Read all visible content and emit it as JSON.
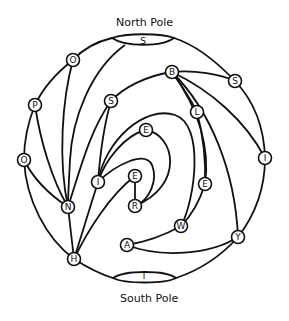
{
  "diagram": {
    "type": "graph on sphere",
    "labels": {
      "north_pole": "North Pole",
      "south_pole": "South Pole"
    },
    "poles": {
      "north": {
        "label": "S",
        "cx": 143,
        "cy": 42
      },
      "south": {
        "label": "T",
        "cx": 144,
        "cy": 278
      }
    },
    "nodes": [
      {
        "id": "O1",
        "label": "O",
        "x": 73,
        "y": 60
      },
      {
        "id": "B",
        "label": "B",
        "x": 172,
        "y": 72
      },
      {
        "id": "S2",
        "label": "S",
        "x": 235,
        "y": 81
      },
      {
        "id": "P",
        "label": "P",
        "x": 35,
        "y": 105
      },
      {
        "id": "S3",
        "label": "S",
        "x": 111,
        "y": 101
      },
      {
        "id": "L",
        "label": "L",
        "x": 197,
        "y": 112
      },
      {
        "id": "E1",
        "label": "E",
        "x": 146,
        "y": 130
      },
      {
        "id": "O2",
        "label": "O",
        "x": 24,
        "y": 160
      },
      {
        "id": "I1",
        "label": "I",
        "x": 265,
        "y": 158
      },
      {
        "id": "I2",
        "label": "I",
        "x": 98,
        "y": 182
      },
      {
        "id": "E2",
        "label": "E",
        "x": 135,
        "y": 176
      },
      {
        "id": "E3",
        "label": "E",
        "x": 205,
        "y": 184
      },
      {
        "id": "N",
        "label": "N",
        "x": 68,
        "y": 207
      },
      {
        "id": "R",
        "label": "R",
        "x": 135,
        "y": 206
      },
      {
        "id": "W",
        "label": "W",
        "x": 181,
        "y": 226
      },
      {
        "id": "A",
        "label": "A",
        "x": 127,
        "y": 245
      },
      {
        "id": "Y",
        "label": "Y",
        "x": 238,
        "y": 237
      },
      {
        "id": "H",
        "label": "H",
        "x": 74,
        "y": 259
      }
    ]
  }
}
